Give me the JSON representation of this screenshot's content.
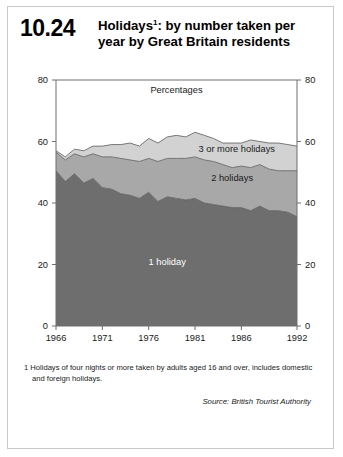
{
  "figure": {
    "number": "10.24",
    "title_line1": "Holidays",
    "title_footnote_marker": "1",
    "title_line1_rest": ": by number taken per",
    "title_line2": "year by Great Britain residents",
    "footnote": "1  Holidays of four nights or more taken by adults aged 16 and over, includes domestic and foreign holidays.",
    "source": "Source: British Tourist Authority"
  },
  "colors": {
    "one_holiday": "#6e6e6e",
    "two_holidays": "#a8a8a8",
    "three_or_more": "#d2d2d2",
    "outline": "#5a5a5a",
    "axis": "#6e6e6e",
    "frame": "#c9c9c9"
  },
  "chart_data": {
    "type": "area",
    "stacked": true,
    "unit_label": "Percentages",
    "xlabel": "",
    "ylabel": "",
    "ylim": [
      0,
      80
    ],
    "yticks": [
      0,
      20,
      40,
      60,
      80
    ],
    "xlim": [
      1966,
      1992
    ],
    "xticks": [
      1966,
      1971,
      1976,
      1981,
      1986,
      1992
    ],
    "grid": false,
    "legend_position": "inline-labels",
    "x": [
      1966,
      1967,
      1968,
      1969,
      1970,
      1971,
      1972,
      1973,
      1974,
      1975,
      1976,
      1977,
      1978,
      1979,
      1980,
      1981,
      1982,
      1983,
      1984,
      1985,
      1986,
      1987,
      1988,
      1989,
      1990,
      1991,
      1992
    ],
    "series": [
      {
        "name": "1 holiday",
        "label": "1 holiday",
        "color": "#6e6e6e",
        "values": [
          50.5,
          47.0,
          49.5,
          46.5,
          48.0,
          45.0,
          44.5,
          43.0,
          42.5,
          41.5,
          43.5,
          40.5,
          42.0,
          41.5,
          41.0,
          41.5,
          40.0,
          39.5,
          39.0,
          38.5,
          38.5,
          37.5,
          39.0,
          37.5,
          37.5,
          37.0,
          35.5
        ]
      },
      {
        "name": "2 holidays",
        "label": "2 holidays",
        "color": "#a8a8a8",
        "values": [
          6.0,
          7.0,
          6.5,
          8.5,
          8.0,
          10.0,
          10.5,
          11.5,
          11.5,
          12.0,
          11.0,
          13.0,
          12.5,
          13.0,
          13.5,
          13.5,
          14.0,
          14.0,
          13.5,
          13.0,
          13.5,
          14.0,
          13.5,
          13.5,
          13.0,
          13.5,
          15.0
        ]
      },
      {
        "name": "3 or more holidays",
        "label": "3 or more holidays",
        "color": "#d2d2d2",
        "values": [
          0.5,
          1.0,
          1.5,
          2.0,
          2.5,
          3.5,
          4.0,
          4.5,
          5.5,
          5.0,
          6.5,
          6.0,
          7.0,
          7.5,
          7.0,
          8.0,
          8.0,
          7.5,
          7.0,
          8.0,
          7.5,
          9.0,
          7.5,
          8.5,
          9.0,
          8.5,
          8.0
        ]
      }
    ],
    "totals": [
      57.0,
      55.0,
      57.5,
      57.0,
      58.5,
      58.5,
      59.0,
      59.0,
      59.5,
      58.5,
      61.0,
      59.5,
      61.5,
      62.0,
      61.5,
      63.0,
      62.0,
      61.0,
      59.5,
      59.5,
      59.5,
      60.5,
      60.0,
      59.5,
      59.5,
      59.0,
      58.5
    ],
    "series_label_positions": [
      {
        "label": "1 holiday",
        "x": 1978,
        "y": 20
      },
      {
        "label": "2 holidays",
        "x": 1985,
        "y": 47
      },
      {
        "label": "3 or more holidays",
        "x": 1985.5,
        "y": 56.5
      }
    ]
  }
}
